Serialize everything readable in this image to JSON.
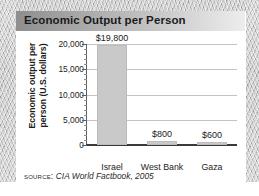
{
  "card": {
    "title": "Economic Output per Person"
  },
  "source": {
    "label": "SOURCE:",
    "citation": "CIA World Factbook, 2005"
  },
  "chart_data": {
    "type": "bar",
    "title": "Economic Output per Person",
    "xlabel": "",
    "ylabel": "Economic output per person (U.S. dollars)",
    "ylabel_line1": "Economic output per",
    "ylabel_line2": "person (U.S. dollars)",
    "categories": [
      "Israel",
      "West Bank",
      "Gaza"
    ],
    "values": [
      19800,
      800,
      600
    ],
    "value_labels": [
      "$19,800",
      "$800",
      "$600"
    ],
    "ylim": [
      0,
      20000
    ],
    "yticks": [
      0,
      5000,
      10000,
      15000,
      20000
    ],
    "ytick_labels": [
      "0",
      "5,000",
      "10,000",
      "15,000",
      "20,000"
    ],
    "minor_tick_step": 1000,
    "grid": true,
    "legend": "none",
    "bar_color": "#c9c9c9",
    "gridline_color": "#c4c4c4",
    "axis_color": "#3a3a3a"
  }
}
